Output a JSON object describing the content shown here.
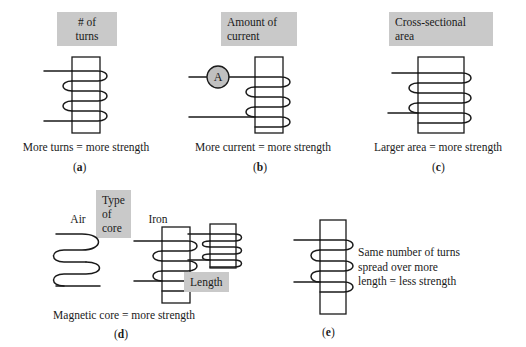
{
  "figure": {
    "type": "diagram",
    "background_color": "#ffffff",
    "ink_color": "#1a1a1a",
    "highlight_color": "#c9c9c9"
  },
  "panels": [
    {
      "id": "a",
      "highlight_label": "# of\nturns",
      "caption": "More turns = more strength",
      "letter_open": "(",
      "letter": "a",
      "letter_close": ")",
      "diagram": "iron-core-coil-3-turns"
    },
    {
      "id": "b",
      "highlight_label": "Amount of\ncurrent",
      "caption": "More current = more strength",
      "letter_open": "(",
      "letter": "b",
      "letter_close": ")",
      "diagram": "iron-core-coil-with-ammeter",
      "meter_symbol": "A"
    },
    {
      "id": "c",
      "highlight_label": "Cross-sectional\narea",
      "caption": "Larger area = more strength",
      "letter_open": "(",
      "letter": "c",
      "letter_close": ")",
      "diagram": "wide-iron-core-coil"
    },
    {
      "id": "d",
      "highlight_label": "Type of core",
      "caption": "Magnetic core = more strength",
      "letter_open": "(",
      "letter": "d",
      "letter_close": ")",
      "sublabels": [
        "Air",
        "Iron"
      ],
      "diagram": "air-coil-vs-iron-core-coil"
    },
    {
      "id": "e",
      "highlight_label": "Length",
      "caption": "Same number of turns\nspread over more\nlength = less strength",
      "letter_open": "(",
      "letter": "e",
      "letter_close": ")",
      "diagram": "short-coil-vs-long-coil"
    }
  ]
}
